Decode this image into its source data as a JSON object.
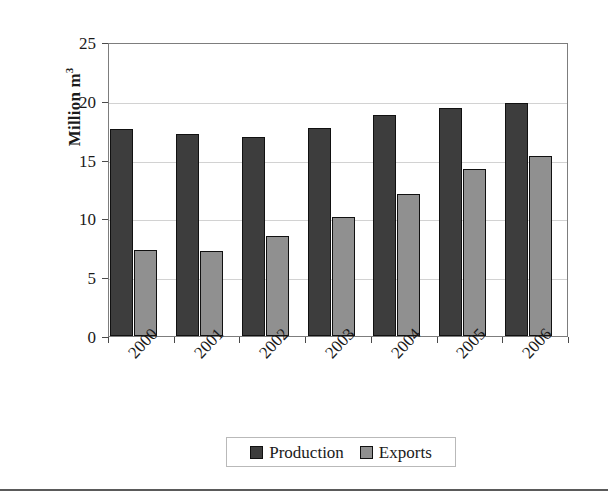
{
  "chart_data": {
    "type": "bar",
    "title": "",
    "subtitle": "",
    "xlabel": "",
    "ylabel": "Million m",
    "ylabel_superscript": "3",
    "categories": [
      "2000",
      "2001",
      "2002",
      "2003",
      "2004",
      "2005",
      "2006"
    ],
    "series": [
      {
        "name": "Production",
        "color": "#3d3d3d",
        "values": [
          17.6,
          17.2,
          16.9,
          17.7,
          18.8,
          19.4,
          19.8
        ]
      },
      {
        "name": "Exports",
        "color": "#909090",
        "values": [
          7.3,
          7.2,
          8.5,
          10.1,
          12.1,
          14.2,
          15.3
        ]
      }
    ],
    "ylim": [
      0,
      25
    ],
    "ytick_labels": [
      "0",
      "5",
      "10",
      "15",
      "20",
      "25"
    ],
    "ytick_values": [
      0,
      5,
      10,
      15,
      20,
      25
    ],
    "grid": "horizontal",
    "legend_position": "bottom",
    "xtick_label_rotation": -47
  },
  "legend": {
    "entries": [
      {
        "label": "Production",
        "swatch": "production-swatch"
      },
      {
        "label": "Exports",
        "swatch": "exports-swatch"
      }
    ]
  },
  "colors": {
    "production": "#3d3d3d",
    "exports": "#909090",
    "gridline": "#d2d2d2",
    "axis": "#7d7d7d",
    "text": "#1a1a1a"
  }
}
